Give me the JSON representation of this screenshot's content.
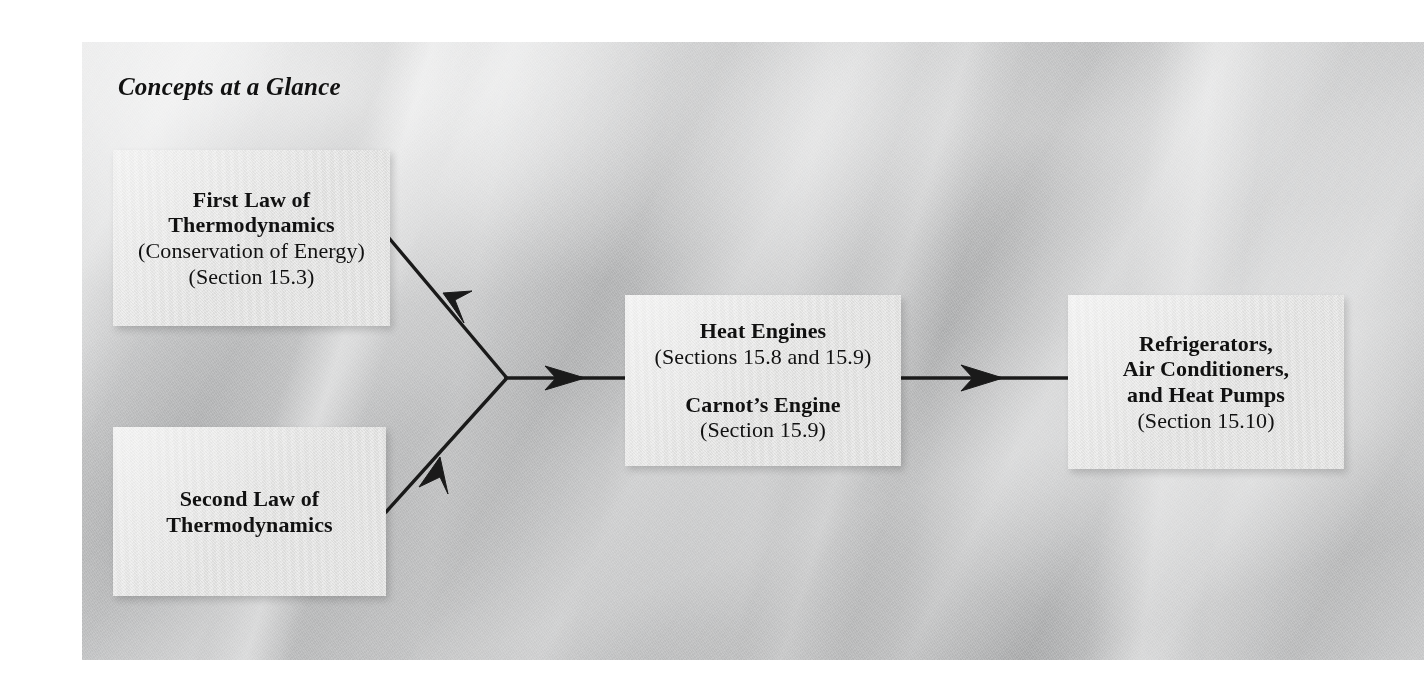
{
  "figure": {
    "heading": "Concepts at a Glance",
    "background_color": "#b9babb",
    "box_color": "#e4e4e3",
    "text_color": "#111111",
    "arrow_color": "#1a1a1a"
  },
  "boxes": {
    "first_law": {
      "line1": "First Law of",
      "line2": "Thermodynamics",
      "line3": "(Conservation of Energy)",
      "line4": "(Section 15.3)"
    },
    "second_law": {
      "line1": "Second Law of",
      "line2": "Thermodynamics"
    },
    "heat_engines": {
      "line1": "Heat Engines",
      "line2": "(Sections 15.8 and 15.9)",
      "line3": "Carnot’s Engine",
      "line4": "(Section 15.9)"
    },
    "refrigerators": {
      "line1": "Refrigerators,",
      "line2": "Air Conditioners,",
      "line3": "and Heat Pumps",
      "line4": "(Section 15.10)"
    }
  },
  "arrows": [
    {
      "name": "first-law-to-junction",
      "from": "first_law",
      "to": "junction",
      "direction": "down-right"
    },
    {
      "name": "second-law-to-junction",
      "from": "second_law",
      "to": "junction",
      "direction": "up-right"
    },
    {
      "name": "junction-to-heat-engines",
      "from": "junction",
      "to": "heat_engines",
      "direction": "right"
    },
    {
      "name": "heat-engines-to-refrigerators",
      "from": "heat_engines",
      "to": "refrigerators",
      "direction": "right"
    }
  ]
}
